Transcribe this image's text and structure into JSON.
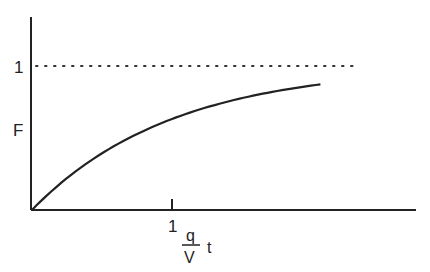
{
  "chart_data": {
    "type": "line",
    "title": "",
    "xlabel": "q/V t",
    "xlabel_parts": {
      "numerator": "q",
      "denominator": "V",
      "suffix": "t"
    },
    "ylabel": "F",
    "x_ticks": [
      {
        "value": 1,
        "label": "1"
      }
    ],
    "y_ticks": [
      {
        "value": 1,
        "label": "1"
      }
    ],
    "xlim": [
      0,
      2.71
    ],
    "ylim": [
      0,
      1.33
    ],
    "grid": false,
    "series": [
      {
        "name": "F = 1 - exp(-qt/V)",
        "style": "solid",
        "x": [
          0,
          0.25,
          0.5,
          0.75,
          1.0,
          1.25,
          1.5,
          1.75,
          2.06
        ],
        "y": [
          0,
          0.221,
          0.393,
          0.528,
          0.632,
          0.713,
          0.777,
          0.826,
          0.873
        ]
      },
      {
        "name": "asymptote F = 1",
        "style": "dotted",
        "x": [
          0,
          2.32
        ],
        "y": [
          1,
          1
        ]
      }
    ],
    "colors": {
      "line": "#222222",
      "axis": "#222222",
      "background": "#ffffff"
    }
  }
}
